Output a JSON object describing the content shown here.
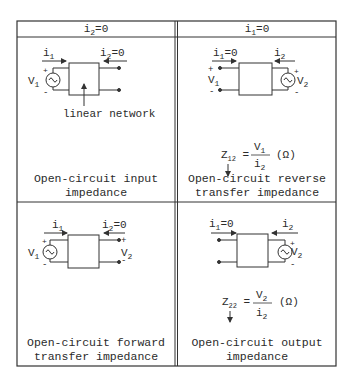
{
  "table": {
    "headers": [
      {
        "var": "i",
        "sub": "2",
        "rest": "=0"
      },
      {
        "var": "i",
        "sub": "1",
        "rest": "=0"
      }
    ],
    "cells": [
      {
        "id": "z11",
        "condition": "i2=0",
        "circuit": {
          "source_side": "left",
          "left_current": "i1",
          "right_current": "i2=0",
          "left_voltage": "V1",
          "right_voltage": ""
        },
        "annotation": "linear network",
        "formula": null,
        "caption_line1": "Open-circuit input",
        "caption_line2": "impedance"
      },
      {
        "id": "z12",
        "condition": "i1=0",
        "circuit": {
          "source_side": "right",
          "left_current": "i1=0",
          "right_current": "i2",
          "left_voltage": "V1",
          "right_voltage": "V2"
        },
        "formula": {
          "lhs": "Z",
          "lhs_sub": "12",
          "num": "V",
          "num_sub": "1",
          "den": "i",
          "den_sub": "2",
          "unit": "(Ω)"
        },
        "caption_line1": "Open-circuit reverse",
        "caption_line2": "transfer impedance"
      },
      {
        "id": "z21",
        "condition": "i2=0",
        "circuit": {
          "source_side": "left",
          "left_current": "i1",
          "right_current": "i2=0",
          "left_voltage": "V1",
          "right_voltage": "V2"
        },
        "formula": null,
        "caption_line1": "Open-circuit forward",
        "caption_line2": "transfer impedance"
      },
      {
        "id": "z22",
        "condition": "i1=0",
        "circuit": {
          "source_side": "right",
          "left_current": "i1=0",
          "right_current": "i2",
          "left_voltage": "",
          "right_voltage": "V2"
        },
        "formula": {
          "lhs": "Z",
          "lhs_sub": "22",
          "num": "V",
          "num_sub": "2",
          "den": "i",
          "den_sub": "2",
          "unit": "(Ω)"
        },
        "caption_line1": "Open-circuit output",
        "caption_line2": "impedance"
      }
    ]
  },
  "colors": {
    "line": "#333333",
    "background": "#ffffff"
  }
}
